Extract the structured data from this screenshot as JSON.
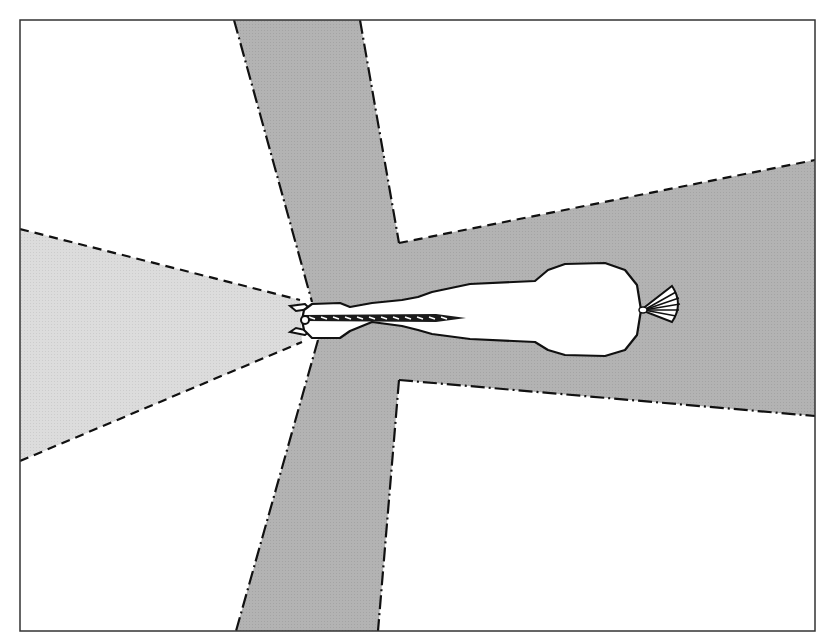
{
  "diagram": {
    "title": "",
    "canvas": {
      "width": 837,
      "height": 640
    },
    "frame": {
      "x": 20,
      "y": 20,
      "width": 795,
      "height": 611,
      "stroke": "#333333"
    },
    "colors": {
      "background": "#ffffff",
      "main_field": "#b3b3b3",
      "binocular_field": "#dcdcdc",
      "boundary": "#111111",
      "horse_fill": "#ffffff",
      "horse_outline": "#111111"
    },
    "regions": [
      {
        "id": "monocular-field",
        "label": "",
        "shade": "main_field",
        "points": [
          [
            234,
            20
          ],
          [
            360,
            20
          ],
          [
            399,
            243
          ],
          [
            815,
            160
          ],
          [
            815,
            416
          ],
          [
            399,
            380
          ],
          [
            378,
            631
          ],
          [
            236,
            631
          ],
          [
            318,
            340
          ],
          [
            312,
            302
          ]
        ]
      },
      {
        "id": "binocular-front-field",
        "label": "",
        "shade": "binocular_field",
        "points": [
          [
            20,
            229
          ],
          [
            300,
            300
          ],
          [
            302,
            342
          ],
          [
            20,
            461
          ]
        ]
      }
    ],
    "boundaries": [
      {
        "id": "top-band-left-edge",
        "style": "dash-dot",
        "points": [
          [
            234,
            20
          ],
          [
            312,
            302
          ]
        ]
      },
      {
        "id": "top-band-right-edge",
        "style": "dash-dot",
        "points": [
          [
            360,
            20
          ],
          [
            399,
            243
          ]
        ]
      },
      {
        "id": "upper-right-edge",
        "style": "dashed",
        "points": [
          [
            399,
            243
          ],
          [
            815,
            160
          ]
        ]
      },
      {
        "id": "lower-right-edge",
        "style": "dash-dot",
        "points": [
          [
            399,
            380
          ],
          [
            815,
            416
          ]
        ]
      },
      {
        "id": "bottom-band-right-edge",
        "style": "dash-dot",
        "points": [
          [
            399,
            380
          ],
          [
            378,
            631
          ]
        ]
      },
      {
        "id": "bottom-band-left-edge",
        "style": "dash-dot",
        "points": [
          [
            318,
            340
          ],
          [
            236,
            631
          ]
        ]
      },
      {
        "id": "front-cone-upper-edge",
        "style": "dashed",
        "points": [
          [
            20,
            229
          ],
          [
            300,
            300
          ]
        ]
      },
      {
        "id": "front-cone-lower-edge",
        "style": "dashed",
        "points": [
          [
            20,
            461
          ],
          [
            302,
            342
          ]
        ]
      }
    ],
    "horse": {
      "orientation": "head-left",
      "body_path": "M312,304 L340,303 L350,307 L372,303 L402,300 L418,297 L432,292 L470,284 L535,281 L548,270 L565,264 L605,263 L625,270 L637,285 L641,310 L637,335 L625,350 L605,356 L565,355 L548,350 L535,342 L470,339 L432,334 L418,330 L402,326 L372,322 L350,331 L340,338 L312,338 L304,330 L302,320 L304,310 Z",
      "ears": [
        "M305,304 L290,306 L296,311 L310,309 Z",
        "M305,335 L290,332 L296,328 L310,331 Z"
      ],
      "mane": {
        "x1": 303,
        "y1": 318,
        "x2": 466,
        "y2": 318
      },
      "tail": {
        "base": [
          641,
          310
        ],
        "fan_tip_top": [
          672,
          286
        ],
        "fan_tip_bottom": [
          672,
          322
        ],
        "rays": 6
      }
    }
  }
}
